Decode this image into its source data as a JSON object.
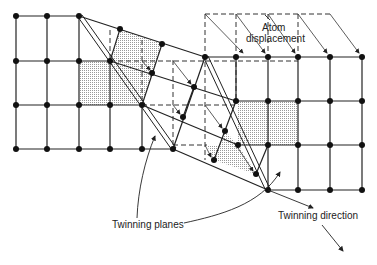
{
  "labels": {
    "atom_displacement_1": "Atom",
    "atom_displacement_2": "displacement",
    "twinning_planes": "Twinning planes",
    "twinning_direction": "Twinning direction"
  },
  "colors": {
    "line": "#222222",
    "shade": "#d8d8d8",
    "background": "#ffffff"
  }
}
